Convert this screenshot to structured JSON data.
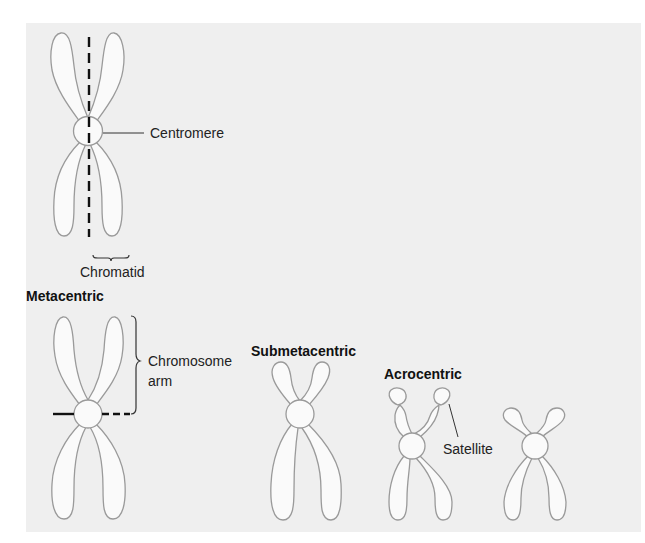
{
  "figure": {
    "background_color": "#efefef",
    "chromosome_fill": "#fafafa",
    "chromosome_stroke": "#9a9a9a",
    "labels": {
      "centromere": "Centromere",
      "chromatid": "Chromatid",
      "chromosome_arm_line1": "Chromosome",
      "chromosome_arm_line2": "arm",
      "satellite": "Satellite"
    },
    "types": [
      {
        "id": "metacentric",
        "title": "Metacentric"
      },
      {
        "id": "submetacentric",
        "title": "Submetacentric"
      },
      {
        "id": "acrocentric",
        "title": "Acrocentric"
      }
    ]
  }
}
